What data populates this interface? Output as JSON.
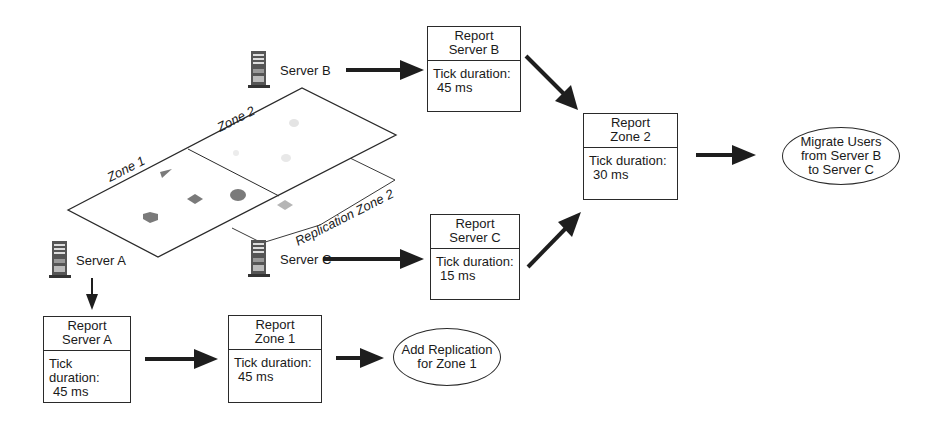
{
  "diagram": {
    "zones": {
      "zone1_label": "Zone 1",
      "zone2_label": "Zone 2",
      "replication_label": "Replication Zone 2"
    },
    "servers": [
      {
        "id": "server-a",
        "label": "Server A",
        "icon": "server-tower-icon"
      },
      {
        "id": "server-b",
        "label": "Server B",
        "icon": "server-tower-icon"
      },
      {
        "id": "server-c",
        "label": "Server C",
        "icon": "server-tower-icon"
      }
    ],
    "reports": {
      "server_b": {
        "title_line1": "Report",
        "title_line2": "Server B",
        "metric_label": "Tick duration:",
        "metric_value": "45 ms"
      },
      "server_c": {
        "title_line1": "Report",
        "title_line2": "Server C",
        "metric_label": "Tick duration:",
        "metric_value": "15 ms"
      },
      "zone2": {
        "title_line1": "Report",
        "title_line2": "Zone 2",
        "metric_label": "Tick duration:",
        "metric_value": "30 ms"
      },
      "server_a": {
        "title_line1": "Report",
        "title_line2": "Server A",
        "metric_label": "Tick duration:",
        "metric_value": "45 ms"
      },
      "zone1": {
        "title_line1": "Report",
        "title_line2": "Zone 1",
        "metric_label": "Tick duration:",
        "metric_value": "45 ms"
      }
    },
    "actions": {
      "migrate": {
        "line1": "Migrate Users",
        "line2": "from Server B",
        "line3": "to Server C"
      },
      "replicate": {
        "line1": "Add Replication",
        "line2": "for Zone 1"
      }
    },
    "flows": [
      {
        "from": "Server B",
        "to": "Report Server B"
      },
      {
        "from": "Server C",
        "to": "Report Server C"
      },
      {
        "from": "Report Server B",
        "to": "Report Zone 2"
      },
      {
        "from": "Report Server C",
        "to": "Report Zone 2"
      },
      {
        "from": "Report Zone 2",
        "to": "Migrate Users from Server B to Server C"
      },
      {
        "from": "Server A",
        "to": "Report Server A"
      },
      {
        "from": "Report Server A",
        "to": "Report Zone 1"
      },
      {
        "from": "Report Zone 1",
        "to": "Add Replication for Zone 1"
      }
    ],
    "colors": {
      "line": "#2a2a2a",
      "arrow": "#1e1e1e",
      "object_dark": "#7a7a7a",
      "object_light": "#b5b5b5",
      "object_faint": "#e4e4e4"
    }
  }
}
